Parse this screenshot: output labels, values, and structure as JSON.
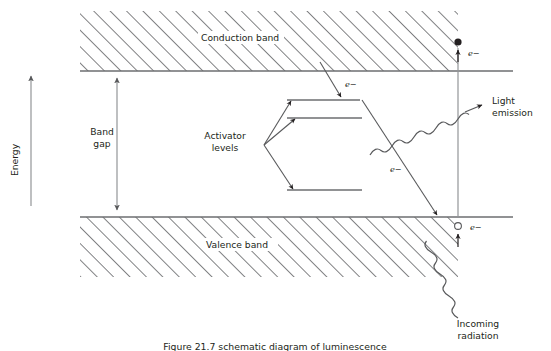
{
  "figure": {
    "title_caption": "Figure 21.7  schematic diagram of luminescence",
    "energy_axis_label": "Energy",
    "bands": {
      "conduction_label": "Conduction band",
      "valence_label": "Valence band",
      "band_gap_label_line1": "Band",
      "band_gap_label_line2": "gap"
    },
    "activator": {
      "label_line1": "Activator",
      "label_line2": "levels",
      "level_count": 3
    },
    "annotations": {
      "electron_cb_to_activator": "e−",
      "electron_excited_top": "e−",
      "electron_activator_to_vb": "e−",
      "electron_valence_hole": "e−",
      "light_emission_line1": "Light",
      "light_emission_line2": "emission",
      "incoming_radiation_line1": "Incoming",
      "incoming_radiation_line2": "radiation"
    },
    "colors": {
      "line": "#6d6e71",
      "hatch": "#58595b",
      "text": "#231f20",
      "background": "#ffffff"
    }
  }
}
